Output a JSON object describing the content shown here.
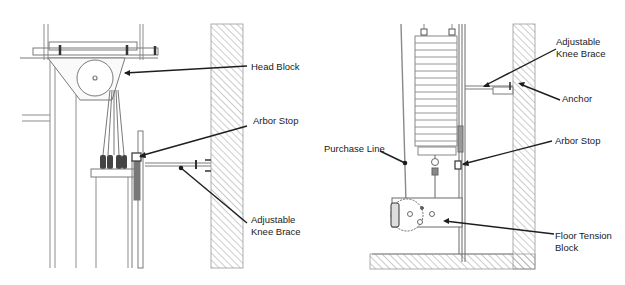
{
  "figure": {
    "type": "technical-diagram",
    "colors": {
      "line": "#8a8a8a",
      "dark_line": "#2a2a2a",
      "leader": "#1e1e1e",
      "hatch": "#9a9a9a",
      "background": "#ffffff"
    }
  },
  "left_view": {
    "labels": {
      "head_block": "Head Block",
      "arbor_stop": "Arbor Stop",
      "knee_brace_line1": "Adjustable",
      "knee_brace_line2": "Knee Brace"
    }
  },
  "right_view": {
    "labels": {
      "knee_brace_line1": "Adjustable",
      "knee_brace_line2": "Knee Brace",
      "anchor": "Anchor",
      "purchase_line": "Purchase Line",
      "arbor_stop": "Arbor Stop",
      "floor_tension_line1": "Floor Tension",
      "floor_tension_line2": "Block"
    }
  }
}
